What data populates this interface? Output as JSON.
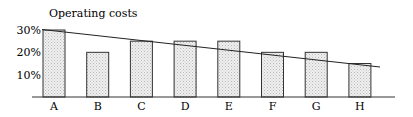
{
  "chart_data": {
    "type": "bar",
    "title": "Operating costs",
    "xlabel": "",
    "ylabel": "",
    "categories": [
      "A",
      "B",
      "C",
      "D",
      "E",
      "F",
      "G",
      "H"
    ],
    "values": [
      30,
      20,
      25,
      25,
      25,
      20,
      20,
      15
    ],
    "value_unit": "%",
    "yticks": [
      "10%",
      "20%",
      "30%"
    ],
    "ylim": [
      0,
      30
    ],
    "grid": false,
    "legend": null,
    "annotations": [
      {
        "type": "trend-line",
        "description": "downward sloping straight line from ~30% at A to ~14% past H"
      }
    ],
    "bar_fill": "#e6e6e6",
    "bar_stroke": "#333333"
  }
}
